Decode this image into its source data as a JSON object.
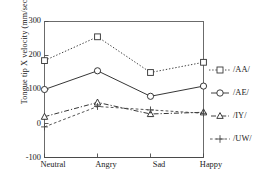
{
  "chart_data": {
    "type": "line",
    "title": "",
    "xlabel": "",
    "ylabel": "Tongue tip X velocity (mm/sec)",
    "categories": [
      "Neutral",
      "Angry",
      "Sad",
      "Happy"
    ],
    "ylim": [
      -100,
      300
    ],
    "yticks": [
      300,
      200,
      100,
      0,
      -100
    ],
    "grid": false,
    "legend_position": "right",
    "series": [
      {
        "name": "/AA/",
        "values": [
          185,
          255,
          150,
          180
        ],
        "marker": "square",
        "linestyle": "dotted",
        "color": "#3a3a3a"
      },
      {
        "name": "/AE/",
        "values": [
          100,
          155,
          80,
          110
        ],
        "marker": "circle",
        "linestyle": "solid",
        "color": "#2b2b2b"
      },
      {
        "name": "/IY/",
        "values": [
          20,
          62,
          28,
          33
        ],
        "marker": "triangle",
        "linestyle": "dashdot",
        "color": "#2b2b2b"
      },
      {
        "name": "/UW/",
        "values": [
          -10,
          50,
          40,
          30
        ],
        "marker": "plus",
        "linestyle": "dashed",
        "color": "#4a4a4a"
      }
    ]
  },
  "axis": {
    "y_title": "Tongue tip X velocity (mm/sec)",
    "y_tick_labels": [
      "300",
      "200",
      "100",
      "0",
      "-100"
    ],
    "x_tick_labels": [
      "Neutral",
      "Angry",
      "Sad",
      "Happy"
    ]
  },
  "legend": {
    "entries": [
      {
        "label": "/AA/"
      },
      {
        "label": "/AE/"
      },
      {
        "label": "/IY/"
      },
      {
        "label": "/UW/"
      }
    ]
  },
  "colors": {
    "axis": "#4a4a4a",
    "text": "#1b1b1b",
    "background": "#ffffff"
  }
}
